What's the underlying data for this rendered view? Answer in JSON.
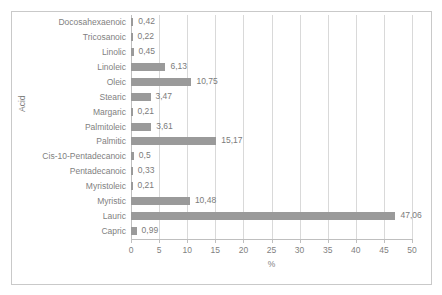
{
  "chart_data": {
    "type": "bar",
    "orientation": "horizontal",
    "title": "",
    "xlabel": "%",
    "ylabel": "Acid",
    "xlim": [
      0,
      50
    ],
    "xticks": [
      "0",
      "5",
      "10",
      "15",
      "20",
      "25",
      "30",
      "35",
      "40",
      "45",
      "50"
    ],
    "grid": "vertical",
    "legend": "none",
    "bar_color": "#9a9a9a",
    "decimal_separator": ",",
    "categories": [
      "Docosahexaenoic",
      "Tricosanoic",
      "Linolic",
      "Linoleic",
      "Oleic",
      "Stearic",
      "Margaric",
      "Palmitoleic",
      "Palmitic",
      "Cis-10-Pentadecanoic",
      "Pentadecanoic",
      "Myristoleic",
      "Myristic",
      "Lauric",
      "Capric"
    ],
    "values": [
      0.42,
      0.22,
      0.45,
      6.13,
      10.75,
      3.47,
      0.21,
      3.61,
      15.17,
      0.5,
      0.33,
      0.21,
      10.48,
      47.06,
      0.99
    ],
    "value_labels": [
      "0,42",
      "0,22",
      "0,45",
      "6,13",
      "10,75",
      "3,47",
      "0,21",
      "3,61",
      "15,17",
      "0,5",
      "0,33",
      "0,21",
      "10,48",
      "47,06",
      "0,99"
    ]
  }
}
